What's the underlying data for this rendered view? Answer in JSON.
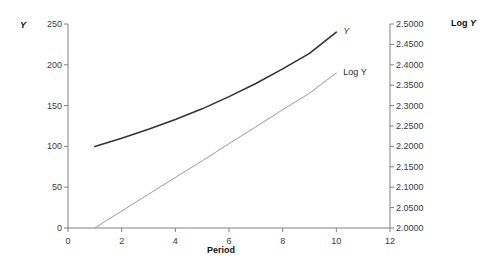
{
  "chart_data": {
    "type": "line",
    "title": "",
    "xlabel": "Period",
    "ylabel_left": "Y",
    "ylabel_right": "Log Y",
    "x": [
      1,
      2,
      3,
      4,
      5,
      6,
      7,
      8,
      9,
      10
    ],
    "xlim": [
      0,
      12
    ],
    "xticks": [
      "0",
      "2",
      "4",
      "6",
      "8",
      "10",
      "12"
    ],
    "xtick_values": [
      0,
      2,
      4,
      6,
      8,
      10,
      12
    ],
    "ylim_left": [
      0,
      250
    ],
    "yticks_left": [
      "0",
      "50",
      "100",
      "150",
      "200",
      "250"
    ],
    "ytick_values_left": [
      0,
      50,
      100,
      150,
      200,
      250
    ],
    "ylim_right": [
      2.0,
      2.5
    ],
    "yticks_right": [
      "2.0000",
      "2.0500",
      "2.1000",
      "2.1500",
      "2.2000",
      "2.2500",
      "2.3000",
      "2.3500",
      "2.4000",
      "2.4500",
      "2.5000"
    ],
    "ytick_values_right": [
      2.0,
      2.05,
      2.1,
      2.15,
      2.2,
      2.25,
      2.3,
      2.35,
      2.4,
      2.45,
      2.5
    ],
    "grid": false,
    "legend_position": "inline-right",
    "series": [
      {
        "name": "Y",
        "axis": "left",
        "color": "#333333",
        "width": 1.6,
        "values": [
          100,
          110,
          121,
          133,
          146,
          161,
          177,
          195,
          214,
          240
        ]
      },
      {
        "name": "Log Y",
        "axis": "right",
        "color": "#9a9a9a",
        "width": 1,
        "values": [
          2.0,
          2.0414,
          2.0828,
          2.1239,
          2.1644,
          2.2068,
          2.248,
          2.29,
          2.3304,
          2.3802
        ]
      }
    ],
    "annotations": [
      {
        "name": "y-curve-label",
        "text": "Y",
        "italic": true
      },
      {
        "name": "logy-curve-label",
        "text": "Log Y",
        "italic": false
      }
    ]
  },
  "axes": {
    "left_title": "Y",
    "right_title": "Log Y",
    "x_title": "Period"
  }
}
